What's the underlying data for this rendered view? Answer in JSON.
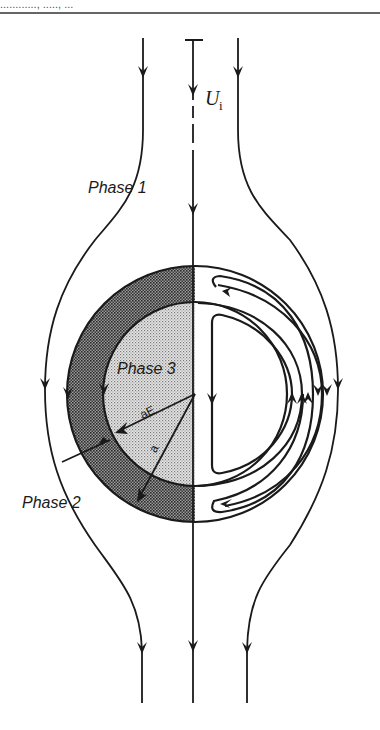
{
  "header": {
    "text_fragment": "............, ....., ...",
    "rule_color": "#333333"
  },
  "labels": {
    "velocity_symbol": "U",
    "velocity_subscript": "i",
    "phase1": "Phase 1",
    "phase2": "Phase 2",
    "phase3": "Phase 3",
    "inner_radius": "aE",
    "outer_radius": "a"
  },
  "colors": {
    "line": "#1a1a1a",
    "phase2_fill": "#6e6e6e",
    "phase3_fill": "#cfcfcf",
    "background": "#ffffff"
  },
  "geometry": {
    "center_x": 195,
    "center_y": 394,
    "outer_radius_px": 128,
    "inner_radius_px": 92
  }
}
